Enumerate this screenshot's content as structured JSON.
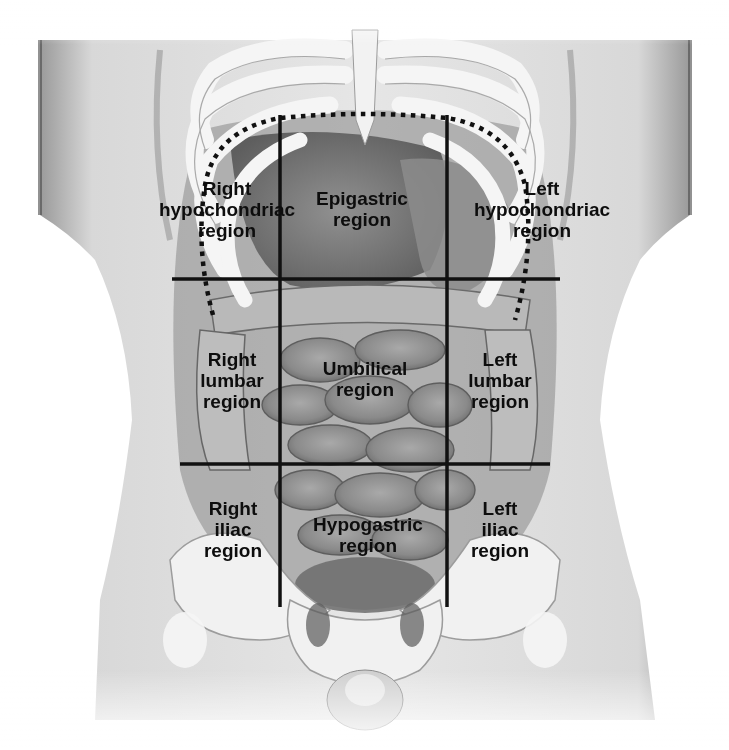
{
  "diagram": {
    "colors": {
      "background": "#ffffff",
      "grid_line": "#111111",
      "label_text": "#0d0d0d",
      "skin_light": "#e4e4e4",
      "skin_mid": "#bdbdbd",
      "organ_dark": "#6f6f6f",
      "bone": "#f4f4f4"
    },
    "regions": [
      {
        "id": "right-hypochondriac",
        "lines": [
          "Right",
          "hypochondriac",
          "region"
        ],
        "x": 227,
        "y": 178
      },
      {
        "id": "epigastric",
        "lines": [
          "Epigastric",
          "region"
        ],
        "x": 362,
        "y": 188
      },
      {
        "id": "left-hypochondriac",
        "lines": [
          "Left",
          "hypochondriac",
          "region"
        ],
        "x": 542,
        "y": 178
      },
      {
        "id": "right-lumbar",
        "lines": [
          "Right",
          "lumbar",
          "region"
        ],
        "x": 232,
        "y": 349
      },
      {
        "id": "umbilical",
        "lines": [
          "Umbilical",
          "region"
        ],
        "x": 365,
        "y": 358
      },
      {
        "id": "left-lumbar",
        "lines": [
          "Left",
          "lumbar",
          "region"
        ],
        "x": 500,
        "y": 349
      },
      {
        "id": "right-iliac",
        "lines": [
          "Right",
          "iliac",
          "region"
        ],
        "x": 233,
        "y": 498
      },
      {
        "id": "hypogastric",
        "lines": [
          "Hypogastric",
          "region"
        ],
        "x": 368,
        "y": 514
      },
      {
        "id": "left-iliac",
        "lines": [
          "Left",
          "iliac",
          "region"
        ],
        "x": 500,
        "y": 498
      }
    ],
    "grid_lines": {
      "vertical": [
        {
          "x": 280,
          "y1": 115,
          "y2": 607
        },
        {
          "x": 447,
          "y1": 115,
          "y2": 607
        }
      ],
      "horizontal": [
        {
          "y": 279,
          "x1": 172,
          "x2": 560
        },
        {
          "y": 464,
          "x1": 180,
          "x2": 550
        }
      ]
    },
    "costal_margin": "dotted curve"
  }
}
